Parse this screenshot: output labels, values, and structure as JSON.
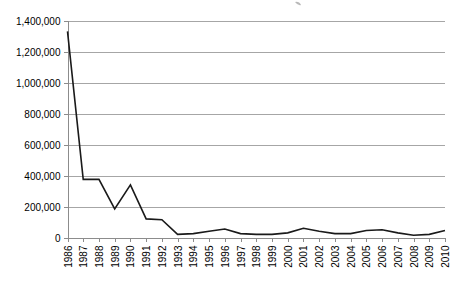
{
  "chart_data": {
    "type": "line",
    "title": "",
    "xlabel": "",
    "ylabel": "",
    "categories": [
      "1986",
      "1987",
      "1988",
      "1989",
      "1990",
      "1991",
      "1992",
      "1993",
      "1994",
      "1995",
      "1996",
      "1997",
      "1998",
      "1999",
      "2000",
      "2001",
      "2002",
      "2003",
      "2004",
      "2005",
      "2006",
      "2007",
      "2008",
      "2009",
      "2010"
    ],
    "values": [
      1330000,
      375000,
      375000,
      185000,
      340000,
      120000,
      115000,
      20000,
      25000,
      40000,
      55000,
      25000,
      20000,
      20000,
      30000,
      60000,
      40000,
      25000,
      25000,
      45000,
      50000,
      30000,
      15000,
      20000,
      45000
    ],
    "series": [
      {
        "name": "series-1",
        "values": [
          1330000,
          375000,
          375000,
          185000,
          340000,
          120000,
          115000,
          20000,
          25000,
          40000,
          55000,
          25000,
          20000,
          20000,
          30000,
          60000,
          40000,
          25000,
          25000,
          45000,
          50000,
          30000,
          15000,
          20000,
          45000
        ]
      }
    ],
    "ylim": [
      0,
      1400000
    ],
    "ytick_values": [
      0,
      200000,
      400000,
      600000,
      800000,
      1000000,
      1200000,
      1400000
    ],
    "ytick_labels": [
      "0",
      "200,000",
      "400,000",
      "600,000",
      "800,000",
      "1,000,000",
      "1,200,000",
      "1,400,000"
    ],
    "xtick_labels": [
      "1986",
      "1987",
      "1988",
      "1989",
      "1990",
      "1991",
      "1992",
      "1993",
      "1994",
      "1995",
      "1996",
      "1997",
      "1998",
      "1999",
      "2000",
      "2001",
      "2002",
      "2003",
      "2004",
      "2005",
      "2006",
      "2007",
      "2008",
      "2009",
      "2010"
    ],
    "grid": "horizontal",
    "legend": "none",
    "line_color": "#1a1a1a",
    "gridline_color": "#a6a6a6",
    "background_color": "#ffffff"
  }
}
